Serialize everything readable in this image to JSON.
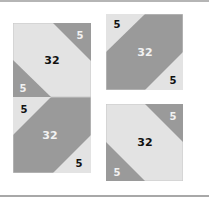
{
  "colors": {
    "light": "#e3e3e3",
    "dark": "#9a9a9a",
    "border": "#c8c8c8",
    "text_dark": "#111111",
    "text_light": "#f2f2f2"
  },
  "tiles": [
    {
      "id": "top-left",
      "center": "32",
      "corner_a": "5",
      "corner_b": "5"
    },
    {
      "id": "top-right",
      "center": "32",
      "corner_a": "5",
      "corner_b": "5"
    },
    {
      "id": "bottom-left",
      "center": "32",
      "corner_a": "5",
      "corner_b": "5"
    },
    {
      "id": "bottom-right",
      "center": "32",
      "corner_a": "5",
      "corner_b": "5"
    }
  ]
}
